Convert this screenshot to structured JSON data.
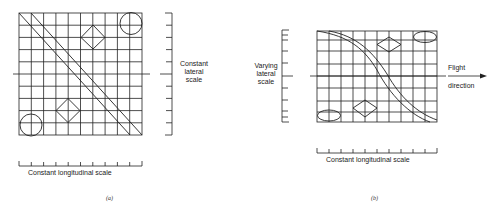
{
  "panel_a": {
    "caption": "(a)",
    "lateral_label_1": "Constant",
    "lateral_label_2": "lateral",
    "lateral_label_3": "scale",
    "longitudinal_label": "Constant longitudinal scale"
  },
  "panel_b": {
    "caption": "(b)",
    "lateral_label_1": "Varying",
    "lateral_label_2": "lateral",
    "lateral_label_3": "scale",
    "flight_label_1": "Flight",
    "flight_label_2": "direction",
    "longitudinal_label": "Constant longitudinal scale"
  },
  "colors": {
    "line": "#222222",
    "background": "#ffffff"
  }
}
